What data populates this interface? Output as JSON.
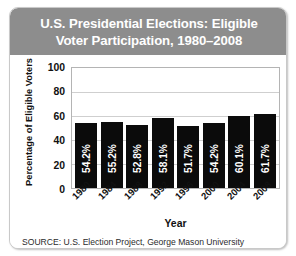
{
  "card": {
    "title_line1": "U.S. Presidential Elections: Eligible",
    "title_line2": "Voter Participation, 1980–2008",
    "source": "SOURCE: U.S. Election Project, George Mason University",
    "header_color": "#8d8d8d",
    "bar_color": "#0b0b0b",
    "background_color": "#ffffff"
  },
  "chart_data": {
    "type": "bar",
    "title": "U.S. Presidential Elections: Eligible Voter Participation, 1980–2008",
    "xlabel": "Year",
    "ylabel": "Percentage of Eligible Voters",
    "categories": [
      "1980",
      "1984",
      "1988",
      "1992",
      "1996",
      "2000",
      "2004",
      "2008"
    ],
    "values": [
      54.2,
      55.2,
      52.8,
      58.1,
      51.7,
      54.2,
      60.1,
      61.7
    ],
    "data_labels": [
      "54.2%",
      "55.2%",
      "52.8%",
      "58.1%",
      "51.7%",
      "54.2%",
      "60.1%",
      "61.7%"
    ],
    "ylim": [
      0,
      100
    ],
    "yticks": [
      "100",
      "80",
      "60",
      "40",
      "20",
      "0"
    ],
    "ytick_values": [
      100,
      80,
      60,
      40,
      20,
      0
    ],
    "grid": true,
    "legend": false,
    "source": "SOURCE: U.S. Election Project, George Mason University"
  }
}
